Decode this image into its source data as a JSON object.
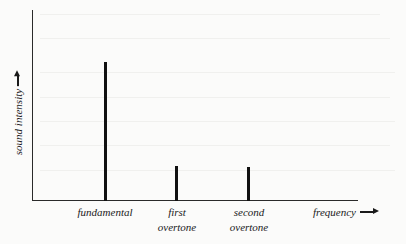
{
  "diagram": {
    "y_axis_label": "sound intensity",
    "x_axis_label": "frequency",
    "components": [
      {
        "name": "fundamental",
        "line1": "fundamental",
        "line2": "",
        "relative_intensity": 1.0
      },
      {
        "name": "first overtone",
        "line1": "first",
        "line2": "overtone",
        "relative_intensity": 0.25
      },
      {
        "name": "second overtone",
        "line1": "second",
        "line2": "overtone",
        "relative_intensity": 0.24
      }
    ],
    "colors": {
      "ink": "#111111",
      "background": "#fbfbfa"
    }
  }
}
